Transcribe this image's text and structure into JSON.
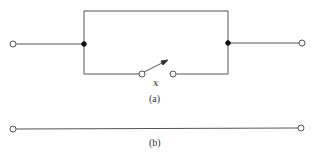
{
  "figure": {
    "part_a": {
      "caption": "(a)",
      "switch_label": "x",
      "terminals": [
        "left-terminal",
        "right-terminal"
      ],
      "junctions": [
        "left-junction",
        "right-junction"
      ]
    },
    "part_b": {
      "caption": "(b)",
      "terminals": [
        "left-terminal",
        "right-terminal"
      ]
    },
    "colors": {
      "wire": "#555555",
      "junction": "#111111",
      "background": "#ffffff"
    }
  }
}
